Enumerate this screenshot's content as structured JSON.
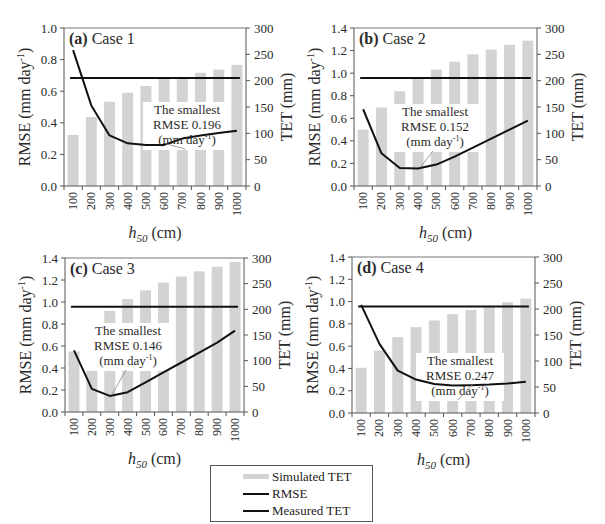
{
  "chart_data": [
    {
      "type": "bar+line",
      "panel_label": "(a)",
      "title": "Case 1",
      "xlabel": "h50 (cm)",
      "ylabel_left": "RMSE (mm day-1)",
      "ylabel_right": "TET (mm)",
      "categories": [
        "100",
        "200",
        "300",
        "400",
        "500",
        "600",
        "700",
        "800",
        "900",
        "1000"
      ],
      "ylim_left": [
        0,
        1.0
      ],
      "yticks_left": [
        "0.0",
        "0.2",
        "0.4",
        "0.6",
        "0.8",
        "1.0"
      ],
      "ylim_right": [
        0,
        300
      ],
      "yticks_right": [
        "0",
        "50",
        "100",
        "150",
        "200",
        "250",
        "300"
      ],
      "series": [
        {
          "name": "Simulated TET",
          "axis": "right",
          "kind": "bar",
          "values": [
            97,
            131,
            160,
            177,
            190,
            205,
            205,
            215,
            221,
            230
          ]
        },
        {
          "name": "RMSE",
          "axis": "left",
          "kind": "line",
          "values": [
            0.86,
            0.51,
            0.32,
            0.27,
            0.26,
            0.26,
            0.3,
            0.32,
            0.335,
            0.35
          ]
        },
        {
          "name": "Measured TET",
          "axis": "right",
          "kind": "hline",
          "value": 205
        }
      ],
      "annotation": {
        "lines": [
          "The smallest",
          "RMSE 0.196",
          "(mm day-1)"
        ],
        "target_index": 5
      }
    },
    {
      "type": "bar+line",
      "panel_label": "(b)",
      "title": "Case 2",
      "xlabel": "h50 (cm)",
      "ylabel_left": "RMSE (mm day-1)",
      "ylabel_right": "TET (mm)",
      "categories": [
        "100",
        "200",
        "300",
        "400",
        "500",
        "600",
        "700",
        "800",
        "900",
        "1000"
      ],
      "ylim_left": [
        0,
        1.4
      ],
      "yticks_left": [
        "0.0",
        "0.2",
        "0.4",
        "0.6",
        "0.8",
        "1.0",
        "1.2",
        "1.4"
      ],
      "ylim_right": [
        0,
        300
      ],
      "yticks_right": [
        "0",
        "50",
        "100",
        "150",
        "200",
        "250",
        "300"
      ],
      "series": [
        {
          "name": "Simulated TET",
          "axis": "right",
          "kind": "bar",
          "values": [
            107,
            149,
            180,
            207,
            221,
            236,
            250,
            259,
            268,
            276
          ]
        },
        {
          "name": "RMSE",
          "axis": "left",
          "kind": "line",
          "values": [
            0.68,
            0.29,
            0.16,
            0.155,
            0.19,
            0.26,
            0.34,
            0.42,
            0.5,
            0.58
          ]
        },
        {
          "name": "Measured TET",
          "axis": "right",
          "kind": "hline",
          "value": 205
        }
      ],
      "annotation": {
        "lines": [
          "The smallest",
          "RMSE 0.152",
          "(mm day-1)"
        ],
        "target_index": 3
      }
    },
    {
      "type": "bar+line",
      "panel_label": "(c)",
      "title": "Case 3",
      "xlabel": "h50 (cm)",
      "ylabel_left": "RMSE (mm day-1)",
      "ylabel_right": "TET (mm)",
      "categories": [
        "100",
        "200",
        "300",
        "400",
        "500",
        "600",
        "700",
        "800",
        "900",
        "1000"
      ],
      "ylim_left": [
        0,
        1.4
      ],
      "yticks_left": [
        "0.0",
        "0.2",
        "0.4",
        "0.6",
        "0.8",
        "1.0",
        "1.2",
        "1.4"
      ],
      "ylim_right": [
        0,
        300
      ],
      "yticks_right": [
        "0",
        "50",
        "100",
        "150",
        "200",
        "250",
        "300"
      ],
      "series": [
        {
          "name": "Simulated TET",
          "axis": "right",
          "kind": "bar",
          "values": [
            118,
            165,
            197,
            220,
            237,
            252,
            264,
            274,
            283,
            292
          ]
        },
        {
          "name": "RMSE",
          "axis": "left",
          "kind": "line",
          "values": [
            0.56,
            0.21,
            0.146,
            0.18,
            0.27,
            0.36,
            0.45,
            0.54,
            0.63,
            0.74
          ]
        },
        {
          "name": "Measured TET",
          "axis": "right",
          "kind": "hline",
          "value": 205
        }
      ],
      "annotation": {
        "lines": [
          "The smallest",
          "RMSE 0.146",
          "(mm day-1)"
        ],
        "target_index": 2
      }
    },
    {
      "type": "bar+line",
      "panel_label": "(d)",
      "title": "Case 4",
      "xlabel": "h50 (cm)",
      "ylabel_left": "RMSE (mm day-1)",
      "ylabel_right": "TET (mm)",
      "categories": [
        "100",
        "200",
        "300",
        "400",
        "500",
        "600",
        "700",
        "800",
        "900",
        "1000"
      ],
      "ylim_left": [
        0,
        1.4
      ],
      "yticks_left": [
        "0.0",
        "0.2",
        "0.4",
        "0.6",
        "0.8",
        "1.0",
        "1.2",
        "1.4"
      ],
      "ylim_right": [
        0,
        300
      ],
      "yticks_right": [
        "0",
        "50",
        "100",
        "150",
        "200",
        "250",
        "300"
      ],
      "series": [
        {
          "name": "Simulated TET",
          "axis": "right",
          "kind": "bar",
          "values": [
            87,
            120,
            146,
            165,
            178,
            190,
            198,
            206,
            213,
            220
          ]
        },
        {
          "name": "RMSE",
          "axis": "left",
          "kind": "line",
          "values": [
            0.97,
            0.62,
            0.38,
            0.3,
            0.26,
            0.247,
            0.25,
            0.255,
            0.265,
            0.28
          ]
        },
        {
          "name": "Measured TET",
          "axis": "right",
          "kind": "hline",
          "value": 205
        }
      ],
      "annotation": {
        "lines": [
          "The smallest",
          "RMSE 0.247",
          "(mm day-1)"
        ],
        "target_index": 6
      }
    }
  ],
  "legend": {
    "items": [
      {
        "label": "Simulated TET",
        "style": "bar"
      },
      {
        "label": "RMSE",
        "style": "line"
      },
      {
        "label": "Measured TET",
        "style": "line"
      }
    ]
  },
  "colors": {
    "bar": "#d3d3d3",
    "line": "#111111",
    "axis": "#555555",
    "text": "#2a2a2a"
  }
}
